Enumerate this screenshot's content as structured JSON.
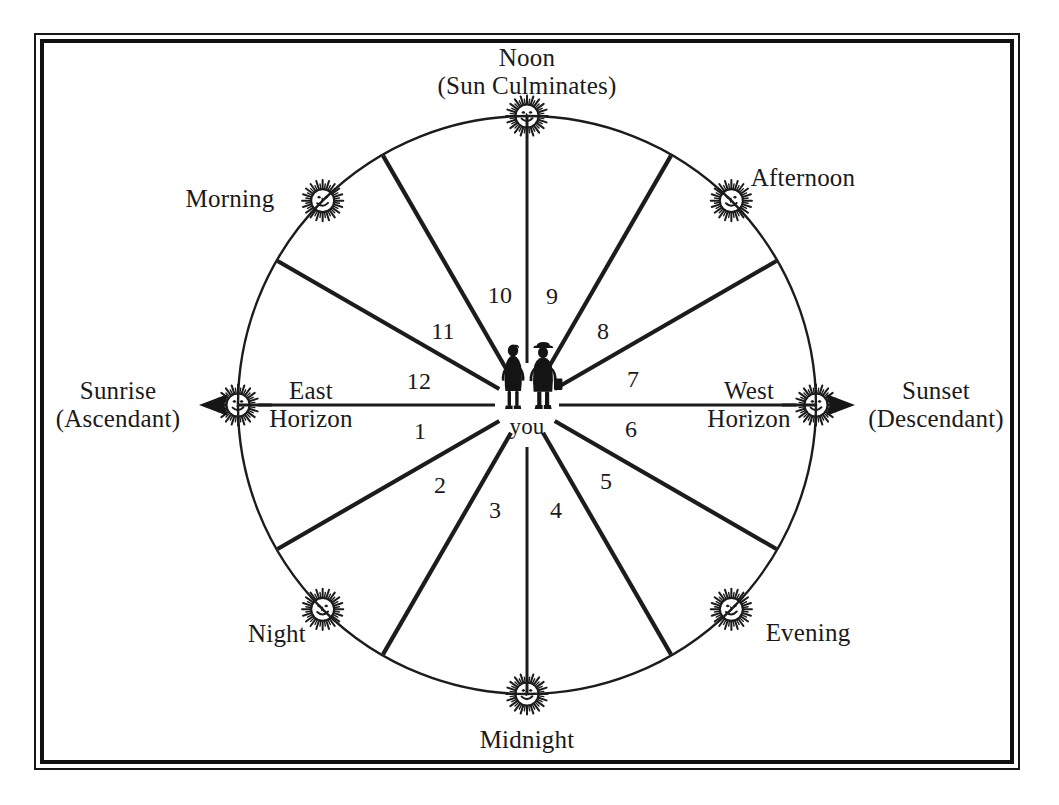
{
  "diagram": {
    "title_top": "Noon\n(Sun Culminates)",
    "center_label": "you",
    "frame": {
      "border_color": "#111111"
    },
    "line_color": "#1c1c1c",
    "cardinal_labels": [
      {
        "name": "noon",
        "text": "Noon\n(Sun Culminates)",
        "x": 527,
        "y": 72,
        "align": "center"
      },
      {
        "name": "midnight",
        "text": "Midnight",
        "x": 527,
        "y": 740,
        "align": "center"
      },
      {
        "name": "sunrise",
        "text": "Sunrise\n(Ascendant)",
        "x": 118,
        "y": 405,
        "align": "center"
      },
      {
        "name": "sunset",
        "text": "Sunset\n(Descendant)",
        "x": 936,
        "y": 405,
        "align": "center"
      },
      {
        "name": "east-horizon",
        "text": "East\nHorizon",
        "x": 311,
        "y": 405,
        "align": "center"
      },
      {
        "name": "west-horizon",
        "text": "West\nHorizon",
        "x": 749,
        "y": 405,
        "align": "center"
      },
      {
        "name": "morning",
        "text": "Morning",
        "x": 230,
        "y": 199,
        "align": "center"
      },
      {
        "name": "afternoon",
        "text": "Afternoon",
        "x": 803,
        "y": 178,
        "align": "center"
      },
      {
        "name": "night",
        "text": "Night",
        "x": 277,
        "y": 634,
        "align": "center"
      },
      {
        "name": "evening",
        "text": "Evening",
        "x": 808,
        "y": 633,
        "align": "center"
      }
    ],
    "house_numbers": [
      {
        "label": "9",
        "x": 552,
        "y": 296
      },
      {
        "label": "10",
        "x": 500,
        "y": 295
      },
      {
        "label": "11",
        "x": 443,
        "y": 331
      },
      {
        "label": "12",
        "x": 419,
        "y": 381
      },
      {
        "label": "1",
        "x": 420,
        "y": 431
      },
      {
        "label": "2",
        "x": 440,
        "y": 485
      },
      {
        "label": "3",
        "x": 495,
        "y": 510
      },
      {
        "label": "4",
        "x": 556,
        "y": 510
      },
      {
        "label": "5",
        "x": 606,
        "y": 481
      },
      {
        "label": "6",
        "x": 631,
        "y": 429
      },
      {
        "label": "7",
        "x": 633,
        "y": 379
      },
      {
        "label": "8",
        "x": 603,
        "y": 331
      }
    ],
    "sun_icons": [
      {
        "name": "sun-noon",
        "angle_deg": -90,
        "position": "top"
      },
      {
        "name": "sun-afternoon",
        "angle_deg": -45,
        "position": "upper-right"
      },
      {
        "name": "sun-sunset",
        "angle_deg": 0,
        "position": "right"
      },
      {
        "name": "sun-evening",
        "angle_deg": 45,
        "position": "lower-right"
      },
      {
        "name": "sun-midnight",
        "angle_deg": 90,
        "position": "bottom"
      },
      {
        "name": "sun-night",
        "angle_deg": 135,
        "position": "lower-left"
      },
      {
        "name": "sun-sunrise",
        "angle_deg": 180,
        "position": "left"
      },
      {
        "name": "sun-morning",
        "angle_deg": -135,
        "position": "upper-left"
      }
    ],
    "arrows": [
      {
        "name": "sunrise-arrow",
        "direction": "left"
      },
      {
        "name": "sunset-arrow",
        "direction": "right"
      }
    ],
    "geometry": {
      "center_x": 527,
      "center_y": 405,
      "radius": 289,
      "spoke_count": 12,
      "spoke_step_deg": 30
    }
  }
}
